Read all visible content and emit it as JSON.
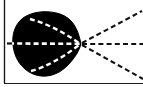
{
  "figure": {
    "canvas": {
      "width": 143,
      "height": 87
    },
    "background_color": "#ffffff"
  },
  "colors": {
    "ink": "#0b0b0b",
    "blob_fill": "#000000",
    "dash_light": "#ffffff",
    "dash_dark": "#111111",
    "border_rule": "#1a1a1a",
    "background": "#ffffff"
  },
  "borders": {
    "left_rule": {
      "x": 4.5,
      "y1": 0,
      "y2": 83,
      "width": 1.4
    },
    "bottom_rule": {
      "x1": 4,
      "x2": 143,
      "y": 83.5,
      "width": 1.2
    }
  },
  "blob": {
    "name": "black-blob",
    "description": "solid black rounded body tapering to a point at the right",
    "left_x": 13,
    "right_vertex_x": 81,
    "top_y": 12,
    "bottom_y": 77,
    "center_y": 44,
    "path": "M 81 44 C 78 28 72 18 60 14 C 48 10 33 11 23 18 C 14 25 12 36 13 45 C 14 57 21 69 33 74 C 45 79 58 75 67 66 C 75 58 79 51 81 44 Z"
  },
  "vertex": {
    "x": 81,
    "y": 44,
    "label": "convergence-point"
  },
  "dashes": {
    "dash_length": 5,
    "gap_length": 3.2,
    "stroke_width": 2.1,
    "light_stroke_width": 2.4
  },
  "inner_rays": [
    {
      "name": "inner-ray-upper",
      "color": "light",
      "path": "M 30 19 C 45 23 62 31 79 43"
    },
    {
      "name": "inner-ray-axis",
      "color": "light",
      "path": "M 9 43.5 L 80 43.8"
    },
    {
      "name": "inner-ray-lower",
      "color": "light",
      "path": "M 31 71 C 46 67 62 58 79 45"
    }
  ],
  "outer_rays": [
    {
      "name": "outer-ray-upper",
      "color": "dark",
      "path": "M 82 43 L 142 11"
    },
    {
      "name": "outer-ray-axis",
      "color": "dark",
      "path": "M 82 44 L 143 44"
    },
    {
      "name": "outer-ray-lower",
      "color": "dark",
      "path": "M 82 45 L 143 79"
    }
  ]
}
